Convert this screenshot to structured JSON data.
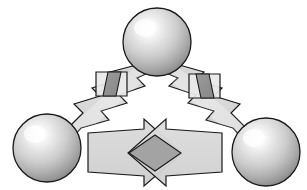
{
  "figure": {
    "type": "diagram",
    "subtype": "node-link-schematic",
    "canvas": {
      "width": 307,
      "height": 190,
      "background": "#ffffff"
    },
    "style": {
      "stroke_color": "#1a1a1a",
      "stroke_width": 1.2,
      "arrow_fill": "#d6d6d6",
      "overlap_fill": "#a3a3a3",
      "marker_fill": "#8f8f8f",
      "marker_box_fill": "#e8e8e8",
      "sphere_highlight": "#ffffff",
      "sphere_midtone": "#d9d9d9",
      "sphere_shadow": "#8a8a8a"
    },
    "nodes": [
      {
        "id": "node-top",
        "name": "sphere-top",
        "label": "",
        "shape": "sphere",
        "cx": 157,
        "cy": 42,
        "r": 34,
        "highlight_x": 0.38,
        "highlight_y": 0.3
      },
      {
        "id": "node-left",
        "name": "sphere-left",
        "label": "",
        "shape": "sphere",
        "cx": 47,
        "cy": 148,
        "r": 34,
        "highlight_x": 0.38,
        "highlight_y": 0.3
      },
      {
        "id": "node-right",
        "name": "sphere-right",
        "label": "",
        "shape": "sphere",
        "cx": 266,
        "cy": 152,
        "r": 34,
        "highlight_x": 0.38,
        "highlight_y": 0.3
      }
    ],
    "edges": [
      {
        "id": "edge-left",
        "name": "lightning-arrow-left",
        "from": "node-left",
        "to": "node-top",
        "style": "lightning-bolt",
        "direction": "bidirectional",
        "label": "",
        "marker": {
          "id": "marker-left",
          "name": "barrier-marker-left",
          "shape": "rect-with-parallelogram",
          "cx": 112,
          "cy": 84,
          "label": ""
        }
      },
      {
        "id": "edge-right",
        "name": "lightning-arrow-right",
        "from": "node-top",
        "to": "node-right",
        "style": "lightning-bolt",
        "direction": "bidirectional",
        "label": "",
        "marker": {
          "id": "marker-right",
          "name": "barrier-marker-right",
          "shape": "rect-with-parallelogram",
          "cx": 203,
          "cy": 86,
          "label": ""
        }
      },
      {
        "id": "edge-bottom",
        "name": "double-headed-arrow-bottom",
        "from": "node-left",
        "to": "node-right",
        "style": "crossed-double-arrow",
        "direction": "bidirectional",
        "label": "",
        "overlap": {
          "id": "overlap-diamond",
          "name": "overlap-diamond",
          "shape": "diamond",
          "cx": 155,
          "cy": 153,
          "label": ""
        }
      }
    ]
  }
}
